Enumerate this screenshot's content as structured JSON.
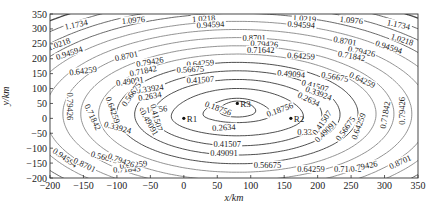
{
  "chart_data": {
    "type": "contour",
    "title": "",
    "xlabel": "x/km",
    "ylabel": "y/km",
    "xlim": [
      -200,
      350
    ],
    "ylim": [
      -200,
      350
    ],
    "xticks": [
      -200,
      -150,
      -100,
      -50,
      0,
      50,
      100,
      150,
      200,
      250,
      300,
      350
    ],
    "yticks": [
      -200,
      -150,
      -100,
      -50,
      0,
      50,
      100,
      150,
      200,
      250,
      300,
      350
    ],
    "grid": false,
    "receivers": [
      {
        "name": "R1",
        "x": 0,
        "y": 0
      },
      {
        "name": "R2",
        "x": 160,
        "y": 0
      },
      {
        "name": "R3",
        "x": 80,
        "y": 50
      }
    ],
    "contour_levels": [
      0.16756,
      0.18756,
      0.2634,
      0.33924,
      0.41507,
      0.49091,
      0.56675,
      0.64259,
      0.71842,
      0.79426,
      0.8701,
      0.94594,
      1.0218,
      1.0976,
      1.1734
    ],
    "contour_labels": [
      {
        "text": "1.1734",
        "x": -160,
        "y": 305,
        "angle": -12
      },
      {
        "text": "1.0976",
        "x": -75,
        "y": 320,
        "angle": -5
      },
      {
        "text": "1.0218",
        "x": -185,
        "y": 240,
        "angle": -20
      },
      {
        "text": "0.94594",
        "x": -170,
        "y": 210,
        "angle": -18
      },
      {
        "text": "1.0218",
        "x": 30,
        "y": 325,
        "angle": -4
      },
      {
        "text": "0.94594",
        "x": 40,
        "y": 305,
        "angle": -3
      },
      {
        "text": "0.8701",
        "x": -85,
        "y": 200,
        "angle": -12
      },
      {
        "text": "0.79426",
        "x": -50,
        "y": 180,
        "angle": -10
      },
      {
        "text": "0.71842",
        "x": -60,
        "y": 150,
        "angle": -12
      },
      {
        "text": "0.8701",
        "x": 105,
        "y": 260,
        "angle": 0
      },
      {
        "text": "0.79426",
        "x": 120,
        "y": 240,
        "angle": 3
      },
      {
        "text": "0.71642",
        "x": 115,
        "y": 220,
        "angle": 0
      },
      {
        "text": "0.64259",
        "x": 175,
        "y": 200,
        "angle": 3
      },
      {
        "text": "1.0219",
        "x": 180,
        "y": 325,
        "angle": 4
      },
      {
        "text": "0.94594",
        "x": 175,
        "y": 305,
        "angle": 4
      },
      {
        "text": "1.0976",
        "x": 250,
        "y": 320,
        "angle": 6
      },
      {
        "text": "1.1734",
        "x": 320,
        "y": 305,
        "angle": 12
      },
      {
        "text": "1.0218",
        "x": 325,
        "y": 255,
        "angle": 18
      },
      {
        "text": "0.94594",
        "x": 305,
        "y": 230,
        "angle": 18
      },
      {
        "text": "0.8701",
        "x": 240,
        "y": 250,
        "angle": 10
      },
      {
        "text": "0.79426",
        "x": 265,
        "y": 215,
        "angle": 12
      },
      {
        "text": "0.71842",
        "x": 250,
        "y": 200,
        "angle": 10
      },
      {
        "text": "0.64259",
        "x": -150,
        "y": 150,
        "angle": -8
      },
      {
        "text": "0.64259",
        "x": 25,
        "y": 175,
        "angle": -4
      },
      {
        "text": "0.56675",
        "x": 10,
        "y": 155,
        "angle": -3
      },
      {
        "text": "0.49091",
        "x": -80,
        "y": 115,
        "angle": -8
      },
      {
        "text": "0.41507",
        "x": 25,
        "y": 120,
        "angle": -3
      },
      {
        "text": "0.49094",
        "x": 160,
        "y": 140,
        "angle": 5
      },
      {
        "text": "0.56675",
        "x": 225,
        "y": 130,
        "angle": 10
      },
      {
        "text": "0.64259",
        "x": 265,
        "y": 120,
        "angle": 25
      },
      {
        "text": "0.41507",
        "x": 195,
        "y": 100,
        "angle": 15
      },
      {
        "text": "0.33924",
        "x": -50,
        "y": 90,
        "angle": -8
      },
      {
        "text": "0.33924",
        "x": 200,
        "y": 75,
        "angle": 20
      },
      {
        "text": "0.2634",
        "x": -50,
        "y": 65,
        "angle": -10
      },
      {
        "text": "0.2634",
        "x": 185,
        "y": 55,
        "angle": 25
      },
      {
        "text": "0.16756",
        "x": -45,
        "y": 20,
        "angle": -5
      },
      {
        "text": "0.18756",
        "x": 50,
        "y": 25,
        "angle": 20
      },
      {
        "text": "0.18756",
        "x": 145,
        "y": 20,
        "angle": -20
      },
      {
        "text": "0.2634",
        "x": 60,
        "y": -40,
        "angle": -3
      },
      {
        "text": "0.33924",
        "x": -100,
        "y": -40,
        "angle": 15
      },
      {
        "text": "0.33924",
        "x": 190,
        "y": -55,
        "angle": 0
      },
      {
        "text": "0.41507",
        "x": 65,
        "y": -95,
        "angle": 0
      },
      {
        "text": "0.49091",
        "x": 60,
        "y": -125,
        "angle": 0
      },
      {
        "text": "0.56675",
        "x": 125,
        "y": -165,
        "angle": 0
      },
      {
        "text": "0.64259",
        "x": 190,
        "y": -180,
        "angle": 0
      },
      {
        "text": "0.71843",
        "x": -85,
        "y": -180,
        "angle": -3
      },
      {
        "text": "0.64259",
        "x": -75,
        "y": -165,
        "angle": -6
      },
      {
        "text": "0.56675",
        "x": -120,
        "y": -140,
        "angle": 15
      },
      {
        "text": "0.71842",
        "x": 245,
        "y": -180,
        "angle": 0
      },
      {
        "text": "0.79426",
        "x": 270,
        "y": -170,
        "angle": -12
      },
      {
        "text": "0.8701",
        "x": 325,
        "y": -155,
        "angle": -25
      },
      {
        "text": "0.94594",
        "x": -180,
        "y": -140,
        "angle": 35
      },
      {
        "text": "0.8701",
        "x": -150,
        "y": -165,
        "angle": 25
      },
      {
        "text": "0.79426",
        "x": -95,
        "y": -150,
        "angle": 20
      },
      {
        "text": "0.79426",
        "x": -175,
        "y": 40,
        "angle": 90
      },
      {
        "text": "0.71842",
        "x": -140,
        "y": 0,
        "angle": 65
      },
      {
        "text": "0.64259",
        "x": -110,
        "y": 25,
        "angle": 70
      },
      {
        "text": "0.56675",
        "x": -75,
        "y": 75,
        "angle": -55
      },
      {
        "text": "0.41507",
        "x": -45,
        "y": 0,
        "angle": 75
      },
      {
        "text": "0.49091",
        "x": -55,
        "y": -20,
        "angle": 60
      },
      {
        "text": "0.41507",
        "x": 210,
        "y": -20,
        "angle": -55
      },
      {
        "text": "0.49091",
        "x": 215,
        "y": -50,
        "angle": -45
      },
      {
        "text": "0.56675",
        "x": 245,
        "y": -40,
        "angle": -55
      },
      {
        "text": "0.64259",
        "x": 265,
        "y": -30,
        "angle": -70
      },
      {
        "text": "0.71842",
        "x": 305,
        "y": 10,
        "angle": -80
      },
      {
        "text": "0.79426",
        "x": 330,
        "y": 25,
        "angle": -90
      }
    ]
  }
}
